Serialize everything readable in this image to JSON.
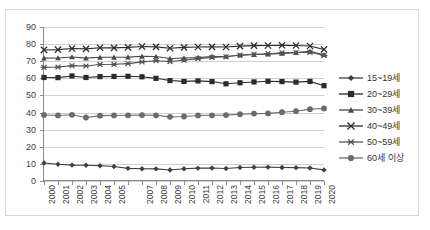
{
  "chart_data": {
    "type": "line",
    "title": "",
    "xlabel": "",
    "ylabel": "",
    "ylim": [
      0,
      90
    ],
    "ytick_step": 10,
    "yticks": [
      "0",
      "10",
      "20",
      "30",
      "40",
      "50",
      "60",
      "70",
      "80",
      "90"
    ],
    "grid": true,
    "legend_position": "right",
    "categories": [
      "2000",
      "2001",
      "2002",
      "2003",
      "2004",
      "2005",
      "2006",
      "2007",
      "2008",
      "2009",
      "2010",
      "2011",
      "2012",
      "2013",
      "2014",
      "2015",
      "2016",
      "2017",
      "2018",
      "2019",
      "2020"
    ],
    "xtick_labels": [
      "2000",
      "2001",
      "2002",
      "2003",
      "2004",
      "2005",
      "",
      "2007",
      "2008",
      "2009",
      "2010",
      "2011",
      "2012",
      "2013",
      "2014",
      "2015",
      "2016",
      "2017",
      "2018",
      "2019",
      "2020"
    ],
    "series": [
      {
        "name": "15~19세",
        "marker": "diamond",
        "color": "#3f3f3f",
        "values": [
          10.5,
          9.8,
          9.3,
          9.2,
          8.9,
          8.5,
          7.4,
          7.2,
          7.1,
          6.4,
          7.2,
          7.5,
          7.6,
          7.3,
          7.9,
          8.0,
          8.1,
          7.9,
          7.8,
          7.6,
          6.5
        ]
      },
      {
        "name": "20~29세",
        "marker": "square",
        "color": "#2b2b2b",
        "values": [
          60.5,
          60.4,
          61.4,
          60.5,
          61.0,
          61.1,
          61.2,
          60.9,
          60.0,
          58.7,
          58.2,
          58.5,
          58.1,
          56.8,
          57.4,
          57.9,
          58.3,
          58.1,
          57.8,
          58.2,
          55.7
        ]
      },
      {
        "name": "30~39세",
        "marker": "triangle",
        "color": "#4a4a4a",
        "values": [
          71.8,
          71.9,
          72.5,
          71.8,
          72.3,
          72.3,
          72.4,
          72.9,
          72.8,
          71.6,
          71.9,
          72.1,
          72.7,
          72.8,
          73.5,
          73.9,
          74.1,
          74.6,
          75.0,
          75.8,
          73.8
        ]
      },
      {
        "name": "40~49세",
        "marker": "x",
        "color": "#2e2e2e",
        "values": [
          76.6,
          76.8,
          77.4,
          77.2,
          77.9,
          77.8,
          78.1,
          78.6,
          78.4,
          77.6,
          78.1,
          78.3,
          78.4,
          78.3,
          78.8,
          79.1,
          79.2,
          79.3,
          79.2,
          78.9,
          76.9
        ]
      },
      {
        "name": "50~59세",
        "marker": "asterisk",
        "color": "#555555",
        "values": [
          66.4,
          66.6,
          67.4,
          67.2,
          68.1,
          68.2,
          68.6,
          69.6,
          70.3,
          69.8,
          70.6,
          71.5,
          72.2,
          72.6,
          73.6,
          74.0,
          74.4,
          74.9,
          75.1,
          75.2,
          73.3
        ]
      },
      {
        "name": "60세 이상",
        "marker": "circle",
        "color": "#6b6b6b",
        "values": [
          38.6,
          38.3,
          38.7,
          37.1,
          38.2,
          38.3,
          38.4,
          38.5,
          38.4,
          37.5,
          37.7,
          38.3,
          38.4,
          38.5,
          39.0,
          39.4,
          39.5,
          40.2,
          40.8,
          42.0,
          42.4
        ]
      }
    ]
  }
}
